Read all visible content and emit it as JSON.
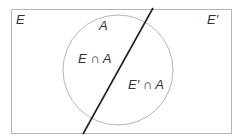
{
  "diagram": {
    "type": "venn",
    "labels": {
      "event": "E",
      "complement": "E′",
      "set_a": "A",
      "intersection_e_a": "E ∩ A",
      "intersection_ec_a": "E′ ∩ A"
    },
    "colors": {
      "rectangle_stroke": "#b5b5b5",
      "circle_stroke": "#b5b5b5",
      "divider_line": "#222222",
      "text": "#333333"
    }
  }
}
